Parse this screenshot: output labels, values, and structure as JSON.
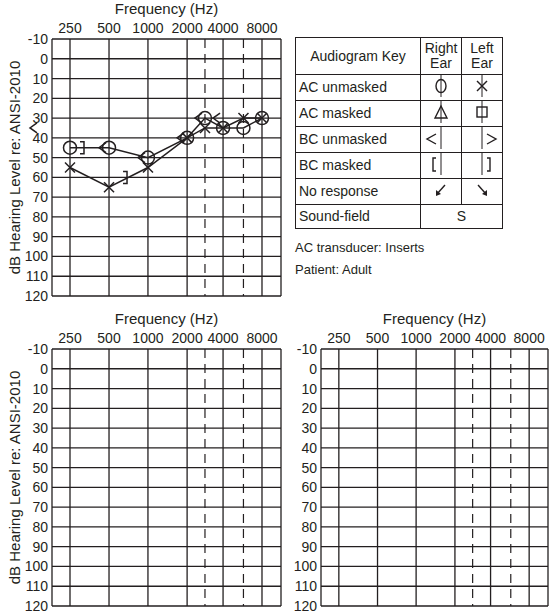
{
  "charts": {
    "frequency_label": "Frequency (Hz)",
    "ylabel": "dB Hearing Level re: ANSI-2010",
    "freq_ticks": [
      "250",
      "500",
      "1000",
      "2000",
      "4000",
      "8000"
    ],
    "db_ticks": [
      "-10",
      "0",
      "10",
      "20",
      "30",
      "40",
      "50",
      "60",
      "70",
      "80",
      "90",
      "100",
      "110",
      "120"
    ]
  },
  "legend": {
    "header": {
      "key": "Audiogram Key",
      "right": "Right Ear",
      "left": "Left Ear"
    },
    "rows": [
      {
        "label": "AC unmasked",
        "right_symbol": "circle",
        "left_symbol": "x"
      },
      {
        "label": "AC masked",
        "right_symbol": "triangle",
        "left_symbol": "square"
      },
      {
        "label": "BC unmasked",
        "right_symbol": "<",
        "left_symbol": ">"
      },
      {
        "label": "BC masked",
        "right_symbol": "[",
        "left_symbol": "]"
      },
      {
        "label": "No response",
        "right_symbol": "arrow-down-left",
        "left_symbol": "arrow-down-right"
      },
      {
        "label": "Sound-field",
        "both_symbol": "S"
      }
    ]
  },
  "info": {
    "transducer": "AC transducer: Inserts",
    "patient": "Patient: Adult"
  },
  "chart_data": [
    {
      "type": "line",
      "title": "Audiogram (completed)",
      "xlabel": "Frequency (Hz)",
      "ylabel": "dB Hearing Level re: ANSI-2010",
      "x": [
        250,
        500,
        1000,
        2000,
        3000,
        4000,
        6000,
        8000
      ],
      "ylim": [
        -10,
        120
      ],
      "y_inverted": true,
      "grid": true,
      "dashed_columns": [
        3000,
        6000
      ],
      "series": [
        {
          "name": "Right AC unmasked (O)",
          "values": [
            45,
            45,
            50,
            40,
            30,
            35,
            35,
            30
          ]
        },
        {
          "name": "Left AC unmasked (X)",
          "values": [
            55,
            65,
            55,
            40,
            35,
            35,
            30,
            30
          ]
        },
        {
          "name": "Right BC unmasked (<)",
          "x": [
            250,
            500,
            1000,
            2000,
            3000,
            4000
          ],
          "values": [
            35,
            45,
            50,
            40,
            30,
            30
          ]
        },
        {
          "name": "Left BC masked (])",
          "x": [
            250,
            500
          ],
          "values": [
            45,
            60
          ]
        }
      ]
    },
    {
      "type": "line",
      "title": "Blank audiogram (lower left)",
      "xlabel": "Frequency (Hz)",
      "ylabel": "dB Hearing Level re: ANSI-2010",
      "x": [
        250,
        500,
        1000,
        2000,
        3000,
        4000,
        6000,
        8000
      ],
      "ylim": [
        -10,
        120
      ],
      "grid": true,
      "series": []
    },
    {
      "type": "line",
      "title": "Blank audiogram (lower right)",
      "xlabel": "Frequency (Hz)",
      "x": [
        250,
        500,
        1000,
        2000,
        3000,
        4000,
        6000,
        8000
      ],
      "ylim": [
        -10,
        120
      ],
      "grid": true,
      "series": []
    }
  ]
}
